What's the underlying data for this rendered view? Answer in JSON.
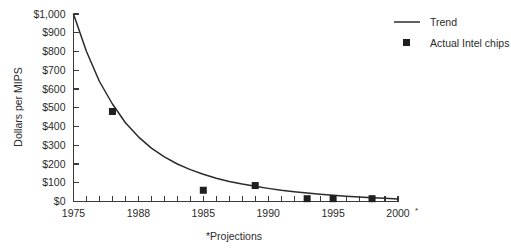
{
  "chart_data": {
    "type": "line",
    "title": "",
    "subtitle": "",
    "xlabel": "",
    "ylabel": "Dollars per MIPS",
    "footnote": "*Projections",
    "xlim": [
      1975,
      2000
    ],
    "ylim": [
      0,
      1000
    ],
    "grid": false,
    "legend_position": "top-right",
    "y_ticks": [
      0,
      100,
      200,
      300,
      400,
      500,
      600,
      700,
      800,
      900,
      1000
    ],
    "y_tick_labels": [
      "$0",
      "$100",
      "$200",
      "$300",
      "$400",
      "$500",
      "$600",
      "$700",
      "$800",
      "$900",
      "$1,000"
    ],
    "x_tick_values": [
      1975,
      1976,
      1977,
      1978,
      1979,
      1980,
      1981,
      1982,
      1983,
      1984,
      1985,
      1986,
      1987,
      1988,
      1989,
      1990,
      1991,
      1992,
      1993,
      1994,
      1995,
      1996,
      1997,
      1998,
      1999,
      2000
    ],
    "x_labeled_ticks": [
      {
        "value": 1975,
        "label": "1975",
        "asterisk": false
      },
      {
        "value": 1980,
        "label": "1988",
        "asterisk": false
      },
      {
        "value": 1985,
        "label": "1985",
        "asterisk": false
      },
      {
        "value": 1990,
        "label": "1990",
        "asterisk": false
      },
      {
        "value": 1995,
        "label": "1995",
        "asterisk": false
      },
      {
        "value": 2000,
        "label": "2000",
        "asterisk": true
      }
    ],
    "series": [
      {
        "name": "Trend",
        "marker": "line",
        "color": "#2b2b2b",
        "x": [
          1975,
          1976,
          1977,
          1978,
          1979,
          1980,
          1981,
          1982,
          1983,
          1984,
          1985,
          1986,
          1987,
          1988,
          1989,
          1990,
          1991,
          1992,
          1993,
          1994,
          1995,
          1996,
          1997,
          1998,
          1999,
          2000
        ],
        "values": [
          1000,
          800,
          640,
          520,
          420,
          345,
          285,
          238,
          200,
          170,
          145,
          124,
          107,
          93,
          81,
          70,
          60,
          52,
          45,
          39,
          33,
          28,
          24,
          20,
          17,
          14
        ]
      },
      {
        "name": "Actual Intel chips",
        "marker": "square",
        "color": "#1f1f1f",
        "x": [
          1978,
          1985,
          1989,
          1993,
          1995,
          1998
        ],
        "values": [
          480,
          60,
          85,
          15,
          15,
          15
        ]
      }
    ],
    "legend": [
      {
        "label": "Trend",
        "marker": "line"
      },
      {
        "label": "Actual Intel chips",
        "marker": "square"
      }
    ]
  }
}
